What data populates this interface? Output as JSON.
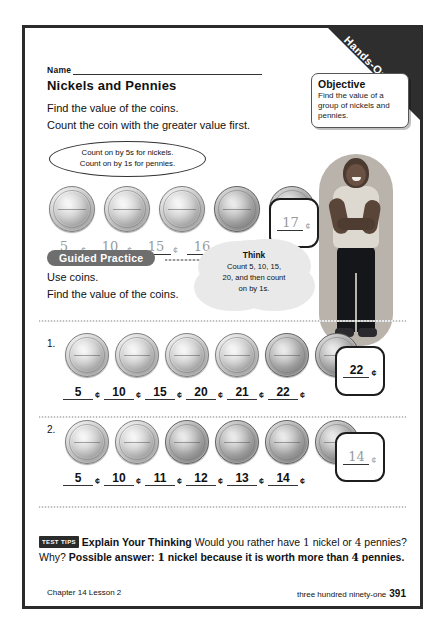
{
  "ribbon": {
    "label": "Hands-On"
  },
  "objective": {
    "title": "Objective",
    "body": "Find the value of a group of nickels and pennies."
  },
  "header": {
    "name_label": "Name",
    "lesson_title": "Nickels and Pennies",
    "instruction_line1": "Find the value of the coins.",
    "instruction_line2": "Count the coin with the greater value first."
  },
  "hint": {
    "line1": "Count on by 5s for nickels.",
    "line2": "Count on by 1s for pennies."
  },
  "example": {
    "coins": [
      "nickel",
      "nickel",
      "nickel",
      "penny",
      "penny"
    ],
    "answers": [
      "5",
      "10",
      "15",
      "16",
      "17"
    ],
    "cent_symbol": "¢",
    "total": "17"
  },
  "guided_practice": {
    "label": "Guided Practice",
    "line1": "Use coins.",
    "line2": "Find the value of the coins."
  },
  "think": {
    "title": "Think",
    "line1": "Count 5, 10, 15,",
    "line2": "20, and then count",
    "line3": "on by 1s."
  },
  "problems": [
    {
      "number": "1.",
      "coins": [
        "nickel",
        "nickel",
        "nickel",
        "nickel",
        "penny",
        "penny"
      ],
      "answers": [
        "5",
        "10",
        "15",
        "20",
        "21",
        "22"
      ],
      "cent_symbol": "¢",
      "total": "22"
    },
    {
      "number": "2.",
      "coins": [
        "nickel",
        "nickel",
        "penny",
        "penny",
        "penny",
        "penny"
      ],
      "answers": [
        "5",
        "10",
        "11",
        "12",
        "13",
        "14"
      ],
      "cent_symbol": "¢",
      "total": "14"
    }
  ],
  "test_tips": {
    "badge": "TEST TIPS",
    "heading": "Explain Your Thinking",
    "question_part1": "Would you rather have",
    "question_num1": "1",
    "question_part2": "nickel",
    "question_part3": "or",
    "question_num2": "4",
    "question_part4": "pennies? Why?",
    "answer_part1": "Possible answer:",
    "answer_num1": "1",
    "answer_part2": "nickel because it is worth more than",
    "answer_num2": "4",
    "answer_part3": "pennies."
  },
  "footer": {
    "chapter": "Chapter 14  Lesson 2",
    "page_words": "three hundred ninety-one",
    "page_number": "391"
  }
}
